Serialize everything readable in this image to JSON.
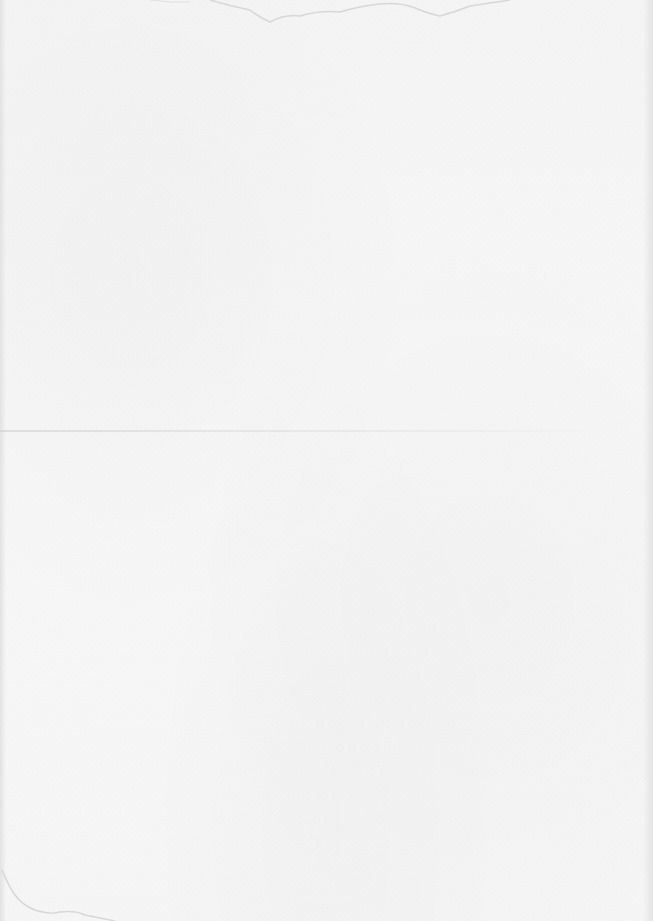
{
  "document": {
    "type": "blank-scanned-page",
    "text_content": "",
    "colors": {
      "paper": "#f5f5f5",
      "stain": "#cfcfcf",
      "crease": "#d0d0d0"
    }
  }
}
